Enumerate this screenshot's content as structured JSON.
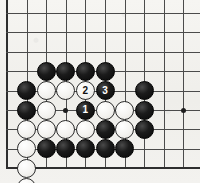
{
  "board": {
    "kind": "go-board-diagram",
    "title": "Go board position diagram",
    "colors": {
      "paper": "#f2f1ee",
      "grid_line": "#4b4b4b",
      "edge_line": "#2e2e2e",
      "black_stone": "#0d0d0d",
      "white_stone": "#f7f6f3",
      "white_stone_outline": "#2b2b2b",
      "black_label_text": "#ffffff",
      "white_label_text": "#111111"
    },
    "geometry": {
      "origin_x": 7,
      "origin_y": 13,
      "spacing_x": 19.6,
      "spacing_y": 19.4,
      "columns": 10,
      "rows": 9,
      "stone_diameter": 19,
      "label_font_size": 10
    },
    "edges": {
      "left": true,
      "top": false,
      "right": false,
      "bottom": true
    },
    "hoshi_points": [
      {
        "name": "star-point-left",
        "col": 3,
        "row": 5
      },
      {
        "name": "star-point-right",
        "col": 9,
        "row": 5
      }
    ],
    "stones": [
      {
        "name": "black-stone-c4",
        "color": "black",
        "col": 2,
        "row": 3,
        "label": ""
      },
      {
        "name": "black-stone-d4",
        "color": "black",
        "col": 3,
        "row": 3,
        "label": ""
      },
      {
        "name": "black-stone-e4",
        "color": "black",
        "col": 4,
        "row": 3,
        "label": ""
      },
      {
        "name": "black-stone-f4",
        "color": "black",
        "col": 5,
        "row": 3,
        "label": ""
      },
      {
        "name": "black-stone-a5",
        "color": "black",
        "col": 1,
        "row": 4,
        "label": ""
      },
      {
        "name": "white-stone-c5",
        "color": "white",
        "col": 2,
        "row": 4,
        "label": ""
      },
      {
        "name": "white-stone-d5",
        "color": "white",
        "col": 3,
        "row": 4,
        "label": ""
      },
      {
        "name": "white-stone-move-2",
        "color": "white",
        "col": 4,
        "row": 4,
        "label": "2"
      },
      {
        "name": "black-stone-move-3",
        "color": "black",
        "col": 5,
        "row": 4,
        "label": "3"
      },
      {
        "name": "black-stone-h5",
        "color": "black",
        "col": 7,
        "row": 4,
        "label": ""
      },
      {
        "name": "black-stone-a6",
        "color": "black",
        "col": 1,
        "row": 5,
        "label": ""
      },
      {
        "name": "white-stone-c6",
        "color": "white",
        "col": 2,
        "row": 5,
        "label": ""
      },
      {
        "name": "black-stone-move-1",
        "color": "black",
        "col": 4,
        "row": 5,
        "label": "1"
      },
      {
        "name": "white-stone-f6",
        "color": "white",
        "col": 5,
        "row": 5,
        "label": ""
      },
      {
        "name": "white-stone-g6",
        "color": "white",
        "col": 6,
        "row": 5,
        "label": ""
      },
      {
        "name": "black-stone-h6",
        "color": "black",
        "col": 7,
        "row": 5,
        "label": ""
      },
      {
        "name": "white-stone-a7",
        "color": "white",
        "col": 1,
        "row": 6,
        "label": ""
      },
      {
        "name": "white-stone-c7",
        "color": "white",
        "col": 2,
        "row": 6,
        "label": ""
      },
      {
        "name": "white-stone-d7",
        "color": "white",
        "col": 3,
        "row": 6,
        "label": ""
      },
      {
        "name": "white-stone-e7",
        "color": "white",
        "col": 4,
        "row": 6,
        "label": ""
      },
      {
        "name": "black-stone-f7",
        "color": "black",
        "col": 5,
        "row": 6,
        "label": ""
      },
      {
        "name": "white-stone-g7",
        "color": "white",
        "col": 6,
        "row": 6,
        "label": ""
      },
      {
        "name": "black-stone-h7",
        "color": "black",
        "col": 7,
        "row": 6,
        "label": ""
      },
      {
        "name": "white-stone-a8",
        "color": "white",
        "col": 1,
        "row": 7,
        "label": ""
      },
      {
        "name": "black-stone-c8",
        "color": "black",
        "col": 2,
        "row": 7,
        "label": ""
      },
      {
        "name": "black-stone-d8",
        "color": "black",
        "col": 3,
        "row": 7,
        "label": ""
      },
      {
        "name": "black-stone-e8",
        "color": "black",
        "col": 4,
        "row": 7,
        "label": ""
      },
      {
        "name": "black-stone-f8",
        "color": "black",
        "col": 5,
        "row": 7,
        "label": ""
      },
      {
        "name": "black-stone-g8",
        "color": "black",
        "col": 6,
        "row": 7,
        "label": ""
      },
      {
        "name": "white-stone-a9",
        "color": "white",
        "col": 1,
        "row": 8,
        "label": ""
      },
      {
        "name": "white-stone-a10-offboard",
        "color": "white",
        "col": 1,
        "row": 9,
        "label": ""
      }
    ],
    "move_sequence": [
      {
        "number": "1",
        "color": "black",
        "stone": "black-stone-move-1"
      },
      {
        "number": "2",
        "color": "white",
        "stone": "white-stone-move-2"
      },
      {
        "number": "3",
        "color": "black",
        "stone": "black-stone-move-3"
      }
    ]
  }
}
